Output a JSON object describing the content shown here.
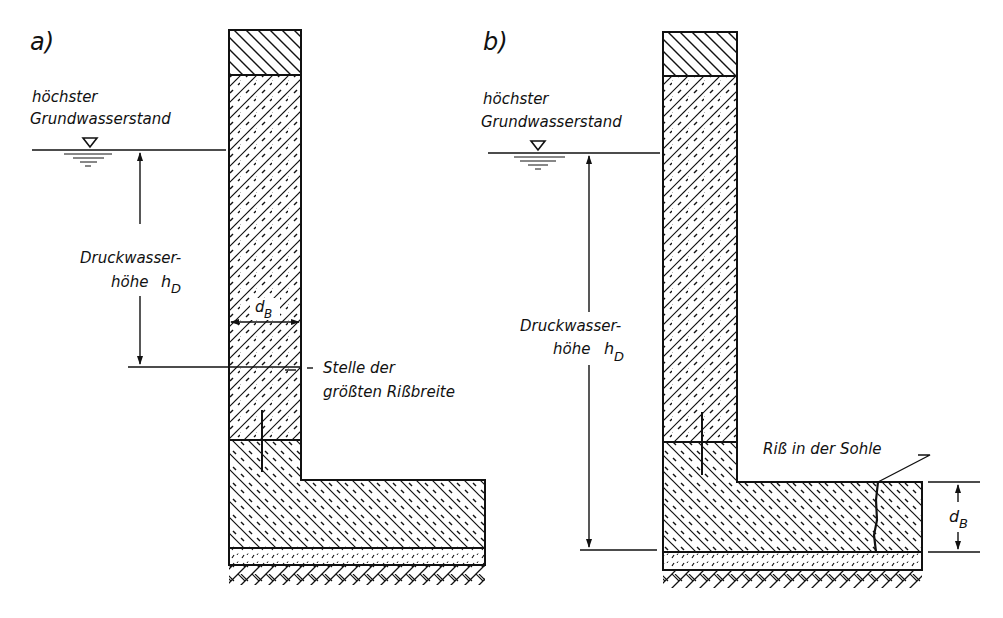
{
  "panels": [
    {
      "id": "a",
      "label": "a)",
      "water_level_label_line1": "höchster",
      "water_level_label_line2": "Grundwasserstand",
      "pressure_label_line1": "Druckwasser-",
      "pressure_label_line2": "höhe",
      "pressure_symbol": "h",
      "pressure_subscript": "D",
      "thickness_symbol": "d",
      "thickness_subscript": "B",
      "callout_line1": "Stelle der",
      "callout_line2": "größten Rißbreite"
    },
    {
      "id": "b",
      "label": "b)",
      "water_level_label_line1": "höchster",
      "water_level_label_line2": "Grundwasserstand",
      "pressure_label_line1": "Druckwasser-",
      "pressure_label_line2": "höhe",
      "pressure_symbol": "h",
      "pressure_subscript": "D",
      "thickness_symbol": "d",
      "thickness_subscript": "B",
      "callout_line1": "Riß in der Sohle"
    }
  ],
  "colors": {
    "ink": "#111111",
    "paper": "#ffffff"
  }
}
